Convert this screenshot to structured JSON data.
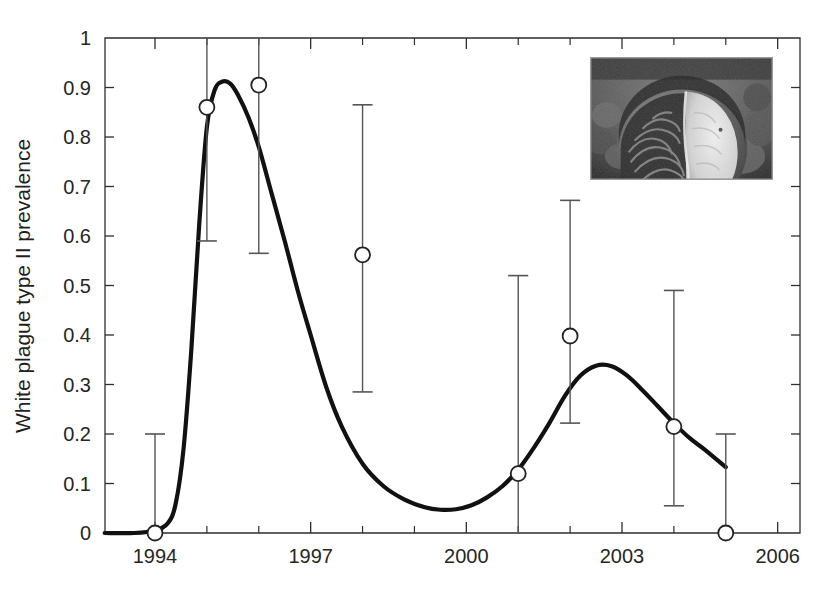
{
  "figure": {
    "background_color": "#ffffff",
    "curve_color": "#111111",
    "marker_color": "#222222",
    "errorbar_color": "#555555",
    "axis_color": "#2e2e2e"
  },
  "inset": {
    "name": "coral-disease-photograph",
    "description": "grayscale underwater photograph of a brain coral colony with a white plague disease lesion on its right side",
    "border_color": "#9a9a9a"
  },
  "chart_data": {
    "type": "scatter",
    "title": "",
    "subtitle": "",
    "xlabel": "",
    "ylabel": "White plague type II prevalence",
    "xlim": [
      1993.03,
      1998.5
    ],
    "ylim": [
      0,
      1
    ],
    "grid": false,
    "legend": null,
    "x_tick_labels": [
      "1994",
      "1997",
      "2000",
      "2003",
      "2006"
    ],
    "x_tick_values": [
      1994,
      1997,
      2000,
      2003,
      2006
    ],
    "x_minor_tick_values": [
      1995,
      1996,
      1998,
      1999,
      2001,
      2002,
      2004,
      2005
    ],
    "y_tick_labels": [
      "0",
      "0.1",
      "0.2",
      "0.3",
      "0.4",
      "0.5",
      "0.6",
      "0.7",
      "0.8",
      "0.9",
      "1"
    ],
    "y_tick_values": [
      0,
      0.1,
      0.2,
      0.3,
      0.4,
      0.5,
      0.6,
      0.7,
      0.8,
      0.9,
      1
    ],
    "x": [
      1994,
      1995,
      1996,
      1998,
      2001,
      2002,
      2004,
      2005
    ],
    "values": [
      0.0,
      0.86,
      0.905,
      0.562,
      0.12,
      0.398,
      0.215,
      0.0
    ],
    "error_low": [
      0.0,
      0.59,
      0.565,
      0.285,
      0.0,
      0.222,
      0.055,
      0.0
    ],
    "error_high": [
      0.2,
      1.0,
      1.0,
      0.865,
      0.52,
      0.672,
      0.49,
      0.2
    ],
    "series": [
      {
        "name": "observed prevalence",
        "marker": "open-circle",
        "categories": [
          1994,
          1995,
          1996,
          1998,
          2001,
          2002,
          2004,
          2005
        ],
        "values": [
          0.0,
          0.86,
          0.905,
          0.562,
          0.12,
          0.398,
          0.215,
          0.0
        ]
      },
      {
        "name": "fitted model curve",
        "type": "line",
        "x": [
          1993.03,
          1993.6,
          1994.0,
          1994.25,
          1994.4,
          1994.55,
          1994.7,
          1994.85,
          1995.0,
          1995.15,
          1995.3,
          1995.45,
          1995.6,
          1995.8,
          1996.0,
          1996.25,
          1996.5,
          1996.75,
          1997.0,
          1997.3,
          1997.6,
          1998.0,
          1998.4,
          1998.8,
          1999.2,
          1999.5,
          1999.8,
          2000.1,
          2000.4,
          2000.7,
          2001.0,
          2001.3,
          2001.6,
          2001.9,
          2002.2,
          2002.5,
          2002.8,
          2003.1,
          2003.4,
          2003.7,
          2004.0,
          2004.3,
          2004.6,
          2005.0
        ],
        "values": [
          0.0,
          0.0,
          0.005,
          0.02,
          0.06,
          0.17,
          0.37,
          0.62,
          0.82,
          0.895,
          0.912,
          0.908,
          0.885,
          0.84,
          0.78,
          0.685,
          0.59,
          0.49,
          0.4,
          0.295,
          0.215,
          0.14,
          0.095,
          0.068,
          0.052,
          0.047,
          0.048,
          0.056,
          0.072,
          0.095,
          0.128,
          0.172,
          0.222,
          0.277,
          0.318,
          0.338,
          0.337,
          0.318,
          0.288,
          0.255,
          0.222,
          0.192,
          0.168,
          0.133
        ]
      }
    ]
  }
}
